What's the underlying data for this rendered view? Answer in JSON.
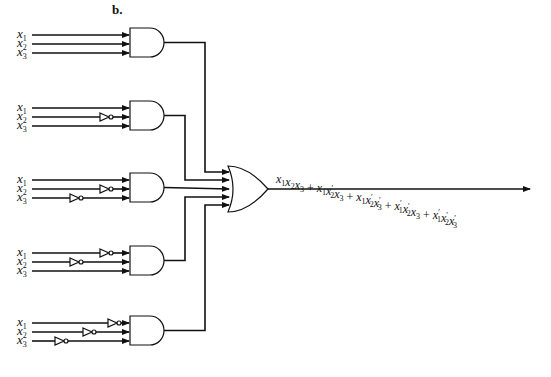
{
  "figure": {
    "panel_label": "b.",
    "colors": {
      "ink": "#111111",
      "background": "#ffffff"
    }
  },
  "inputs": [
    "x1",
    "x2",
    "x3"
  ],
  "gates": [
    {
      "name": "and-gate-1",
      "type": "AND",
      "inverted_inputs": [],
      "term": "x1x2x3"
    },
    {
      "name": "and-gate-2",
      "type": "AND",
      "inverted_inputs": [
        "x2"
      ],
      "term": "x1x2'x3"
    },
    {
      "name": "and-gate-3",
      "type": "AND",
      "inverted_inputs": [
        "x2",
        "x3"
      ],
      "term": "x1x2'x3'"
    },
    {
      "name": "and-gate-4",
      "type": "AND",
      "inverted_inputs": [
        "x1",
        "x2"
      ],
      "term": "x1'x2'x3"
    },
    {
      "name": "and-gate-5",
      "type": "AND",
      "inverted_inputs": [
        "x1",
        "x2",
        "x3"
      ],
      "term": "x1'x2'x3'"
    }
  ],
  "or_gate": {
    "type": "OR",
    "inputs": 5
  },
  "output_expression": "x1x2x3 + x1x2'x3 + x1x2'x3' + x1'x2'x3 + x1'x2'x3'"
}
